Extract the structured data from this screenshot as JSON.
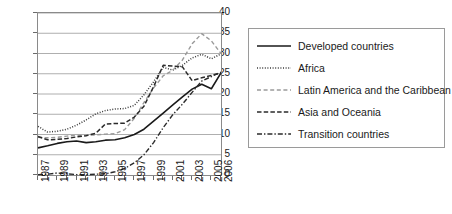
{
  "chart_data": {
    "type": "line",
    "title": "",
    "xlabel": "",
    "ylabel": "",
    "xlim": [
      1987,
      2006
    ],
    "ylim": [
      0,
      40
    ],
    "ytick_step": 5,
    "yticks": [
      0,
      5,
      10,
      15,
      20,
      25,
      30,
      35,
      40
    ],
    "grid": true,
    "legend_position": "right",
    "x": [
      1987,
      1988,
      1989,
      1990,
      1991,
      1992,
      1993,
      1994,
      1995,
      1996,
      1997,
      1998,
      1999,
      2000,
      2001,
      2002,
      2003,
      2004,
      2005,
      2006
    ],
    "xtick_labels": [
      "1987",
      "1989",
      "1991",
      "1993",
      "1995",
      "1997",
      "1999",
      "2001",
      "2003",
      "2005",
      "2006"
    ],
    "series": [
      {
        "name": "Developed countries",
        "style": "solid",
        "color": "#1a1a1a",
        "values": [
          6.7,
          7.2,
          7.8,
          8.2,
          8.4,
          8.0,
          8.2,
          8.6,
          8.7,
          9.2,
          10.0,
          11.3,
          13.3,
          15.3,
          17.3,
          19.3,
          21.2,
          22.4,
          21.3,
          25.2
        ]
      },
      {
        "name": "Africa",
        "style": "dotted",
        "color": "#3a3a3a",
        "values": [
          12.0,
          10.6,
          10.8,
          11.3,
          12.3,
          13.6,
          15.1,
          15.9,
          16.3,
          16.4,
          17.2,
          19.8,
          23.0,
          26.6,
          25.9,
          27.1,
          28.9,
          29.8,
          28.7,
          29.9
        ]
      },
      {
        "name": "Latin America and the Caribbean",
        "style": "dashed-light",
        "color": "#9a9a9a",
        "values": [
          9.3,
          9.2,
          9.3,
          9.6,
          9.8,
          9.8,
          9.9,
          10.1,
          10.2,
          11.2,
          14.0,
          17.9,
          21.5,
          24.5,
          25.9,
          28.4,
          32.4,
          34.9,
          33.1,
          30.0
        ]
      },
      {
        "name": "Asia and Oceania",
        "style": "dashed",
        "color": "#2a2a2a",
        "values": [
          9.5,
          8.7,
          8.8,
          9.0,
          9.4,
          9.7,
          10.3,
          12.6,
          12.7,
          12.8,
          14.3,
          17.0,
          21.8,
          27.1,
          26.9,
          26.7,
          23.3,
          24.0,
          24.6,
          25.2
        ]
      },
      {
        "name": "Transition countries",
        "style": "dash-dot",
        "color": "#2a2a2a",
        "values": [
          0.1,
          0.2,
          0.5,
          0.3,
          0.1,
          0.1,
          0.2,
          0.3,
          0.8,
          1.6,
          3.0,
          5.0,
          8.0,
          11.7,
          14.9,
          17.5,
          20.4,
          23.2,
          24.3,
          25.4
        ]
      }
    ]
  },
  "legend": {
    "items": [
      {
        "label": "Developed countries"
      },
      {
        "label": "Africa"
      },
      {
        "label": "Latin America and the Caribbean"
      },
      {
        "label": "Asia and Oceania"
      },
      {
        "label": "Transition countries"
      }
    ]
  }
}
